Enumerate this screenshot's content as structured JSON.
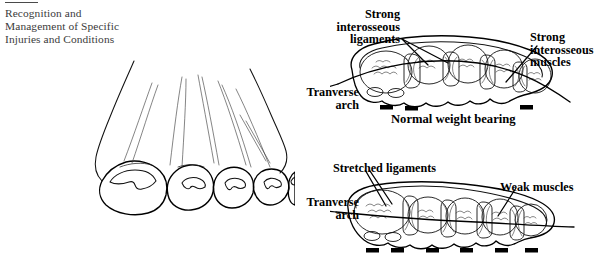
{
  "page": {
    "width": 605,
    "height": 258,
    "background": "#ffffff",
    "ink": "#111111"
  },
  "running_head": {
    "rule": true,
    "lines": [
      "Recognition and",
      "Management of Specific",
      "Injuries and Conditions"
    ]
  },
  "figures": [
    {
      "id": "foot-front-view",
      "name": "foot-line-drawing",
      "description": "Front view line drawing of a foot with five toes and toenails",
      "toe_count": 5
    },
    {
      "id": "normal-arch-cross-section",
      "name": "normal-weight-bearing-diagram",
      "caption": "Normal weight bearing",
      "labels": [
        {
          "name": "strong-interosseous-ligaments",
          "text": "Strong\ninterosseous\nligaments",
          "lines": [
            "Strong",
            "interosseous",
            "ligaments"
          ],
          "align": "right"
        },
        {
          "name": "strong-interosseous-muscles",
          "text": "Strong\ninterosseous\nmuscles",
          "lines": [
            "Strong",
            "interosseous",
            "muscles"
          ],
          "align": "left"
        },
        {
          "name": "tranverse-arch",
          "text": "Tranverse\narch",
          "lines": [
            "Tranverse",
            "arch"
          ],
          "align": "right"
        }
      ],
      "weight_bearing_marks": 3,
      "metatarsal_count": 5,
      "arch_state": "raised"
    },
    {
      "id": "fallen-arch-cross-section",
      "name": "fallen-arch-diagram",
      "caption": "",
      "labels": [
        {
          "name": "stretched-ligaments",
          "text": "Stretched ligaments",
          "lines": [
            "Stretched ligaments"
          ],
          "align": "left"
        },
        {
          "name": "weak-muscles",
          "text": "Weak muscles",
          "lines": [
            "Weak muscles"
          ],
          "align": "left"
        },
        {
          "name": "tranverse-arch",
          "text": "Tranverse\narch",
          "lines": [
            "Tranverse",
            "arch"
          ],
          "align": "right"
        }
      ],
      "weight_bearing_marks": 6,
      "metatarsal_count": 5,
      "arch_state": "collapsed"
    }
  ],
  "labels": {
    "strong_ligaments": {
      "l1": "Strong",
      "l2": "interosseous",
      "l3": "ligaments"
    },
    "strong_muscles": {
      "l1": "Strong",
      "l2": "interosseous",
      "l3": "muscles"
    },
    "arch_top": {
      "l1": "Tranverse",
      "l2": "arch"
    },
    "arch_bottom": {
      "l1": "Tranverse",
      "l2": "arch"
    },
    "normal_weight_bearing": "Normal weight bearing",
    "stretched_ligaments": "Stretched ligaments",
    "weak_muscles": "Weak muscles"
  }
}
